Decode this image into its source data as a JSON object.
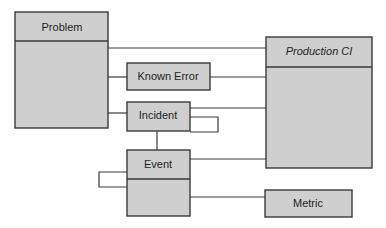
{
  "diagram": {
    "title": "",
    "colors": {
      "box_fill": "#cfcfcf",
      "box_stroke": "#3a3a3a",
      "text": "#1e1e1e",
      "background": "#ffffff"
    },
    "entities": {
      "problem": {
        "label": "Problem",
        "has_body": true,
        "italic": false
      },
      "known_error": {
        "label": "Known Error",
        "has_body": false,
        "italic": false
      },
      "incident": {
        "label": "Incident",
        "has_body": false,
        "italic": false
      },
      "event": {
        "label": "Event",
        "has_body": true,
        "italic": false
      },
      "production_ci": {
        "label": "Production CI",
        "has_body": true,
        "italic": true
      },
      "metric": {
        "label": "Metric",
        "has_body": false,
        "italic": false
      }
    },
    "relationships": [
      {
        "from": "Problem",
        "to": "Production CI"
      },
      {
        "from": "Problem",
        "to": "Known Error"
      },
      {
        "from": "Problem",
        "to": "Incident"
      },
      {
        "from": "Known Error",
        "to": "Production CI"
      },
      {
        "from": "Incident",
        "to": "Production CI"
      },
      {
        "from": "Incident",
        "to": "Incident",
        "type": "self-loop"
      },
      {
        "from": "Incident",
        "to": "Event"
      },
      {
        "from": "Event",
        "to": "Event",
        "type": "self-loop"
      },
      {
        "from": "Event",
        "to": "Production CI"
      },
      {
        "from": "Event",
        "to": "Metric"
      }
    ]
  }
}
